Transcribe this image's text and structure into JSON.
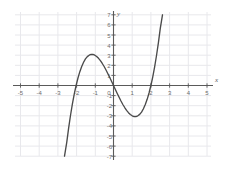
{
  "chart_data": {
    "type": "line",
    "title": "",
    "subtitle": "",
    "xlabel": "x",
    "ylabel": "y",
    "xlim": [
      -5,
      5
    ],
    "ylim": [
      -7,
      7
    ],
    "grid": true,
    "legend": null,
    "function": "y = x^3 - 4x",
    "x_ticks": [
      -5,
      -4,
      -3,
      -2,
      -1,
      0,
      1,
      2,
      3,
      4,
      5
    ],
    "x_tick_labels": [
      "-5",
      "-4",
      "-3",
      "-2",
      "-1",
      "0",
      "1",
      "2",
      "3",
      "4",
      "5"
    ],
    "y_ticks": [
      -7,
      -6,
      -5,
      -4,
      -3,
      -2,
      -1,
      1,
      2,
      3,
      4,
      5,
      6,
      7
    ],
    "y_tick_labels": [
      "-7",
      "-6",
      "-5",
      "-4",
      "-3",
      "-2",
      "-1",
      "1",
      "2",
      "3",
      "4",
      "5",
      "6",
      "7"
    ],
    "series": [
      {
        "name": "cubic",
        "color": "#4a4a4a",
        "x_domain": [
          -2.62,
          2.62
        ],
        "points": [
          [
            -2.62,
            -7.0
          ],
          [
            -2.5,
            -5.63
          ],
          [
            -2.4,
            -4.22
          ],
          [
            -2.3,
            -2.97
          ],
          [
            -2.2,
            -1.85
          ],
          [
            -2.1,
            -0.86
          ],
          [
            -2.0,
            0.0
          ],
          [
            -1.9,
            0.74
          ],
          [
            -1.8,
            1.37
          ],
          [
            -1.7,
            1.89
          ],
          [
            -1.6,
            2.3
          ],
          [
            -1.5,
            2.63
          ],
          [
            -1.4,
            2.86
          ],
          [
            -1.3,
            3.0
          ],
          [
            -1.2,
            3.07
          ],
          [
            -1.15,
            3.08
          ],
          [
            -1.1,
            3.07
          ],
          [
            -1.0,
            3.0
          ],
          [
            -0.9,
            2.87
          ],
          [
            -0.8,
            2.69
          ],
          [
            -0.7,
            2.46
          ],
          [
            -0.6,
            2.18
          ],
          [
            -0.5,
            1.88
          ],
          [
            -0.4,
            1.54
          ],
          [
            -0.3,
            1.17
          ],
          [
            -0.2,
            0.79
          ],
          [
            -0.1,
            0.4
          ],
          [
            0.0,
            0.0
          ],
          [
            0.1,
            -0.4
          ],
          [
            0.2,
            -0.79
          ],
          [
            0.3,
            -1.17
          ],
          [
            0.4,
            -1.54
          ],
          [
            0.5,
            -1.88
          ],
          [
            0.6,
            -2.18
          ],
          [
            0.7,
            -2.46
          ],
          [
            0.8,
            -2.69
          ],
          [
            0.9,
            -2.87
          ],
          [
            1.0,
            -3.0
          ],
          [
            1.1,
            -3.07
          ],
          [
            1.15,
            -3.08
          ],
          [
            1.2,
            -3.07
          ],
          [
            1.3,
            -3.0
          ],
          [
            1.4,
            -2.86
          ],
          [
            1.5,
            -2.63
          ],
          [
            1.6,
            -2.3
          ],
          [
            1.7,
            -1.89
          ],
          [
            1.8,
            -1.37
          ],
          [
            1.9,
            -0.74
          ],
          [
            2.0,
            0.0
          ],
          [
            2.1,
            0.86
          ],
          [
            2.2,
            1.85
          ],
          [
            2.3,
            2.97
          ],
          [
            2.4,
            4.22
          ],
          [
            2.5,
            5.63
          ],
          [
            2.62,
            7.0
          ]
        ],
        "roots": [
          -2,
          0,
          2
        ],
        "local_max": [
          -1.15,
          3.08
        ],
        "local_min": [
          1.15,
          -3.08
        ]
      }
    ],
    "colors": {
      "curve": "#4a4a4a",
      "axis": "#5a5a5a",
      "grid": "#e8e8ec",
      "tick_text": "#6d6d6d",
      "background": "#ffffff"
    }
  }
}
